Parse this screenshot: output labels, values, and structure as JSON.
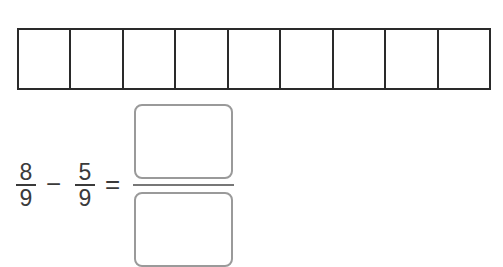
{
  "fraction_bar": {
    "cells": 9
  },
  "equation": {
    "first": {
      "numerator": "8",
      "denominator": "9"
    },
    "operator": "−",
    "second": {
      "numerator": "5",
      "denominator": "9"
    },
    "equals": "=",
    "answer": {
      "numerator": "",
      "denominator": ""
    }
  },
  "colors": {
    "bar_border": "#2a2a2a",
    "answer_box_border": "#9a9a9a",
    "text": "#3a3a3a"
  }
}
